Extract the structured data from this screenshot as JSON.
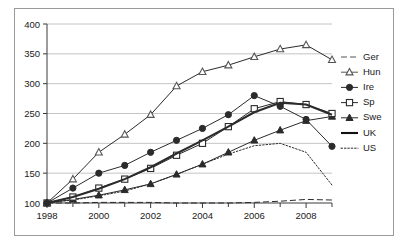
{
  "chart_data": {
    "type": "line",
    "title": "",
    "xlabel": "",
    "ylabel": "",
    "xlim": [
      1998,
      2009
    ],
    "ylim": [
      100,
      400
    ],
    "ytick_step": 50,
    "yticks": [
      100,
      150,
      200,
      250,
      300,
      350,
      400
    ],
    "xticks_major": [
      1998,
      2000,
      2002,
      2004,
      2006,
      2008
    ],
    "xticks_minor": [
      1999,
      2001,
      2003,
      2005,
      2007,
      2009
    ],
    "x": [
      1998,
      1999,
      2000,
      2001,
      2002,
      2003,
      2004,
      2005,
      2006,
      2007,
      2008,
      2009
    ],
    "grid": "horizontal",
    "legend_position": "right",
    "series": [
      {
        "name": "Ger",
        "label": "Ger",
        "style": "dashed",
        "marker": "none",
        "color": "#555555",
        "values": [
          100,
          100,
          101,
          101,
          101,
          100,
          100,
          100,
          101,
          103,
          106,
          105
        ]
      },
      {
        "name": "Hun",
        "label": "Hun",
        "style": "solid",
        "marker": "open-triangle",
        "color": "#555555",
        "values": [
          100,
          140,
          185,
          215,
          248,
          296,
          320,
          331,
          345,
          358,
          365,
          340
        ]
      },
      {
        "name": "Ire",
        "label": "Ire",
        "style": "solid",
        "marker": "filled-circle",
        "color": "#2b2b2b",
        "values": [
          100,
          125,
          150,
          163,
          185,
          205,
          225,
          248,
          280,
          262,
          240,
          195
        ]
      },
      {
        "name": "Sp",
        "label": "Sp",
        "style": "solid",
        "marker": "open-square",
        "color": "#2b2b2b",
        "values": [
          100,
          110,
          125,
          140,
          158,
          180,
          200,
          228,
          258,
          270,
          265,
          250
        ]
      },
      {
        "name": "Swe",
        "label": "Swe",
        "style": "solid",
        "marker": "filled-triangle",
        "color": "#2b2b2b",
        "values": [
          100,
          106,
          113,
          122,
          132,
          148,
          165,
          185,
          205,
          222,
          238,
          245
        ]
      },
      {
        "name": "UK",
        "label": "UK",
        "style": "solid-thick",
        "marker": "none",
        "color": "#111111",
        "values": [
          100,
          110,
          124,
          140,
          160,
          183,
          205,
          228,
          252,
          268,
          265,
          248
        ]
      },
      {
        "name": "US",
        "label": "US",
        "style": "dotted",
        "marker": "none",
        "color": "#2b2b2b",
        "values": [
          100,
          105,
          112,
          120,
          132,
          148,
          165,
          182,
          196,
          200,
          185,
          130
        ]
      }
    ]
  }
}
